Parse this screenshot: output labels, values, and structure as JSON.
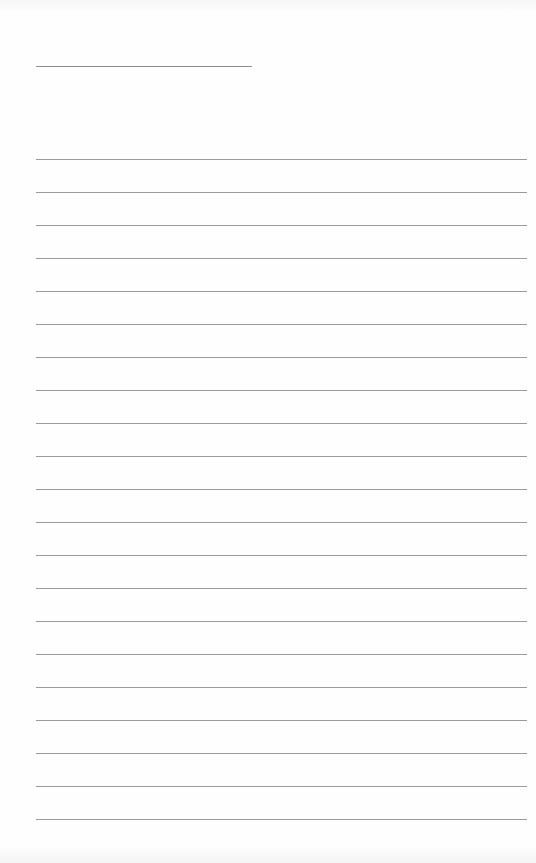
{
  "page": {
    "type": "lined-paper",
    "background_color": "#fdfdfd",
    "line_color": "#9a9a9a",
    "title_line": {
      "left": 36,
      "top": 66,
      "width": 216
    },
    "ruled_lines": {
      "count": 21,
      "left": 36,
      "width": 491,
      "first_top": 159,
      "spacing": 33
    }
  }
}
